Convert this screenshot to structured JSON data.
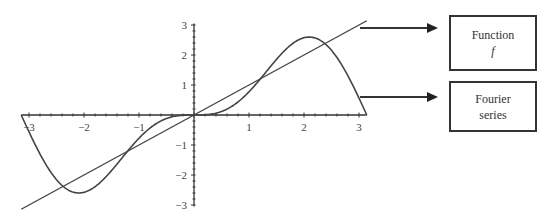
{
  "chart_data": {
    "type": "line",
    "title": "",
    "xlabel": "",
    "ylabel": "",
    "xlim": [
      -3.14159,
      3.14159
    ],
    "ylim": [
      -3.1,
      3.1
    ],
    "x_ticks": [
      -3,
      -2,
      -1,
      1,
      2,
      3
    ],
    "y_ticks": [
      -3,
      -2,
      -1,
      1,
      2,
      3
    ],
    "x_tick_labels": [
      "−3",
      "−2",
      "−1",
      "1",
      "2",
      "3"
    ],
    "y_tick_labels": [
      "3",
      "2",
      "1",
      "−1",
      "−2",
      "−3"
    ],
    "grid": false,
    "series": [
      {
        "name": "Function f",
        "expression": "f(x) = x",
        "x": [
          -3.14159,
          3.14159
        ],
        "y": [
          -3.14159,
          3.14159
        ]
      },
      {
        "name": "Fourier series",
        "expression": "2 sin x - sin 2x",
        "x": [
          -3.14,
          -3.0,
          -2.5,
          -2.1,
          -1.5,
          -1.0,
          -0.5,
          0,
          0.5,
          1.0,
          1.5,
          2.1,
          2.5,
          3.0,
          3.14
        ],
        "y": [
          0.0,
          -0.0,
          -2.16,
          -2.6,
          -2.14,
          -0.77,
          -0.12,
          0.0,
          0.12,
          0.77,
          2.14,
          2.6,
          2.16,
          0.0,
          0.0
        ]
      }
    ],
    "annotations": [
      {
        "label": "Function f",
        "points_to": "straight line"
      },
      {
        "label": "Fourier series",
        "points_to": "curve"
      }
    ],
    "legend_position": "right"
  },
  "legend": {
    "function_label": "Function",
    "function_symbol": "f",
    "fourier_line1": "Fourier",
    "fourier_line2": "series"
  },
  "colors": {
    "line": "#444444",
    "axis": "#333333",
    "background": "#ffffff"
  }
}
